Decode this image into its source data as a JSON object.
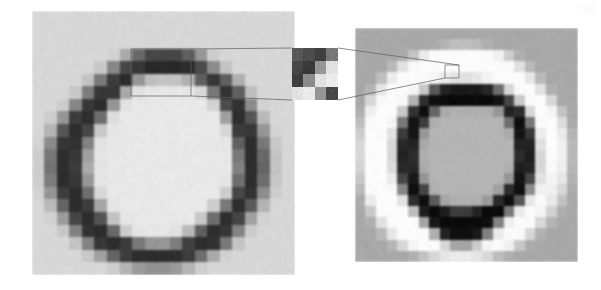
{
  "figure": {
    "background_color": "#ffffff",
    "width": 601,
    "height": 290,
    "caption": "",
    "annotation_color": "#5c5c5c"
  },
  "panels": {
    "left": {
      "name": "original-image-panel",
      "label": "",
      "x": 32,
      "y": 11,
      "width": 263,
      "height": 264,
      "background_color": "#dcdcdc",
      "grid_cols": 21,
      "grid_rows": 21,
      "description": "Low-contrast pixelated ring glyph on light gray field",
      "pixels": [
        [
          215,
          215,
          215,
          215,
          215,
          215,
          215,
          215,
          215,
          215,
          215,
          215,
          215,
          215,
          215,
          215,
          215,
          215,
          215,
          215,
          215
        ],
        [
          215,
          215,
          215,
          215,
          215,
          215,
          215,
          215,
          215,
          215,
          215,
          215,
          215,
          215,
          215,
          215,
          215,
          215,
          215,
          215,
          215
        ],
        [
          215,
          215,
          215,
          215,
          215,
          215,
          215,
          215,
          215,
          215,
          215,
          215,
          215,
          215,
          215,
          215,
          215,
          215,
          215,
          215,
          215
        ],
        [
          215,
          215,
          215,
          215,
          215,
          215,
          210,
          170,
          105,
          70,
          70,
          70,
          95,
          150,
          205,
          215,
          215,
          215,
          215,
          215,
          215
        ],
        [
          215,
          215,
          215,
          215,
          215,
          200,
          135,
          70,
          55,
          40,
          40,
          40,
          45,
          75,
          140,
          195,
          215,
          215,
          215,
          215,
          215
        ],
        [
          215,
          215,
          215,
          215,
          195,
          120,
          60,
          45,
          150,
          190,
          195,
          195,
          175,
          95,
          55,
          95,
          175,
          215,
          215,
          215,
          215
        ],
        [
          215,
          215,
          215,
          200,
          125,
          55,
          55,
          170,
          225,
          230,
          230,
          230,
          230,
          215,
          120,
          50,
          95,
          190,
          215,
          215,
          215
        ],
        [
          215,
          215,
          205,
          135,
          55,
          45,
          150,
          225,
          232,
          232,
          232,
          232,
          232,
          232,
          210,
          75,
          50,
          140,
          210,
          215,
          215
        ],
        [
          215,
          205,
          150,
          60,
          45,
          110,
          220,
          232,
          232,
          232,
          232,
          232,
          232,
          232,
          232,
          160,
          45,
          85,
          185,
          215,
          215
        ],
        [
          215,
          180,
          85,
          45,
          70,
          200,
          230,
          232,
          232,
          232,
          232,
          232,
          232,
          232,
          232,
          215,
          60,
          55,
          150,
          210,
          215
        ],
        [
          210,
          140,
          55,
          50,
          130,
          225,
          232,
          232,
          232,
          232,
          232,
          232,
          232,
          232,
          232,
          230,
          95,
          45,
          120,
          200,
          215
        ],
        [
          205,
          120,
          45,
          55,
          160,
          228,
          232,
          232,
          232,
          232,
          232,
          232,
          232,
          232,
          232,
          232,
          120,
          45,
          105,
          195,
          215
        ],
        [
          205,
          115,
          45,
          60,
          170,
          228,
          232,
          232,
          232,
          232,
          232,
          232,
          232,
          232,
          232,
          232,
          130,
          45,
          100,
          195,
          215
        ],
        [
          205,
          125,
          45,
          55,
          150,
          228,
          232,
          232,
          232,
          232,
          232,
          232,
          232,
          232,
          232,
          228,
          110,
          45,
          110,
          198,
          215
        ],
        [
          210,
          150,
          60,
          45,
          110,
          215,
          232,
          232,
          232,
          232,
          232,
          232,
          232,
          232,
          232,
          205,
          70,
          50,
          140,
          205,
          215
        ],
        [
          215,
          185,
          100,
          45,
          60,
          165,
          228,
          232,
          232,
          232,
          232,
          232,
          232,
          232,
          205,
          120,
          45,
          90,
          180,
          215,
          215
        ],
        [
          215,
          210,
          155,
          70,
          45,
          85,
          195,
          230,
          232,
          232,
          232,
          232,
          232,
          200,
          110,
          45,
          70,
          160,
          210,
          215,
          215
        ],
        [
          215,
          215,
          200,
          130,
          50,
          45,
          105,
          205,
          228,
          230,
          230,
          225,
          185,
          95,
          45,
          55,
          130,
          205,
          215,
          215,
          215
        ],
        [
          215,
          215,
          215,
          195,
          130,
          55,
          45,
          60,
          120,
          150,
          150,
          125,
          65,
          45,
          50,
          120,
          195,
          215,
          215,
          215,
          215
        ],
        [
          215,
          215,
          215,
          215,
          200,
          160,
          100,
          60,
          45,
          45,
          45,
          45,
          60,
          110,
          170,
          210,
          215,
          215,
          215,
          215,
          215
        ],
        [
          215,
          215,
          215,
          215,
          215,
          215,
          205,
          180,
          155,
          145,
          145,
          155,
          180,
          205,
          215,
          215,
          215,
          215,
          215,
          215,
          215
        ]
      ]
    },
    "inset": {
      "name": "magnified-pixel-inset",
      "label": "",
      "x": 292,
      "y": 48,
      "width": 46,
      "height": 52,
      "background_color": "#f2f2f2",
      "grid_cols": 4,
      "grid_rows": 4,
      "description": "Extreme magnification of a 4x4 pixel neighbourhood taken from the top edge of the ring",
      "pixels": [
        [
          88,
          75,
          62,
          120
        ],
        [
          70,
          58,
          150,
          225
        ],
        [
          62,
          140,
          225,
          235
        ],
        [
          225,
          235,
          150,
          72
        ]
      ]
    },
    "right": {
      "name": "enhanced-image-panel",
      "label": "",
      "x": 355,
      "y": 28,
      "width": 223,
      "height": 234,
      "background_color": "#a8a8a8",
      "grid_cols": 21,
      "grid_rows": 21,
      "description": "Contrast-enhanced version of the same ring showing a bright white halo and near-black stroke",
      "pixels": [
        [
          168,
          168,
          168,
          168,
          168,
          168,
          168,
          168,
          168,
          168,
          168,
          168,
          168,
          168,
          168,
          168,
          168,
          168,
          168,
          168,
          168
        ],
        [
          168,
          168,
          168,
          168,
          168,
          168,
          168,
          170,
          180,
          190,
          190,
          185,
          175,
          168,
          168,
          168,
          168,
          168,
          168,
          168,
          168
        ],
        [
          168,
          168,
          168,
          168,
          172,
          195,
          235,
          250,
          252,
          252,
          252,
          252,
          250,
          240,
          205,
          175,
          168,
          168,
          168,
          168,
          168
        ],
        [
          168,
          168,
          168,
          185,
          225,
          250,
          252,
          252,
          252,
          252,
          252,
          252,
          252,
          252,
          250,
          225,
          185,
          168,
          168,
          168,
          168
        ],
        [
          168,
          168,
          190,
          235,
          252,
          252,
          250,
          245,
          235,
          225,
          225,
          230,
          242,
          250,
          252,
          252,
          230,
          185,
          168,
          168,
          168
        ],
        [
          168,
          180,
          230,
          252,
          252,
          245,
          200,
          90,
          35,
          25,
          25,
          25,
          40,
          110,
          215,
          250,
          252,
          225,
          175,
          168,
          168
        ],
        [
          168,
          215,
          250,
          252,
          248,
          180,
          45,
          15,
          10,
          10,
          10,
          10,
          10,
          20,
          70,
          200,
          250,
          252,
          215,
          168,
          168
        ],
        [
          175,
          240,
          252,
          252,
          200,
          50,
          15,
          100,
          170,
          175,
          175,
          175,
          175,
          150,
          35,
          45,
          215,
          252,
          245,
          195,
          168
        ],
        [
          190,
          250,
          252,
          245,
          120,
          20,
          60,
          175,
          180,
          180,
          180,
          180,
          180,
          180,
          110,
          15,
          120,
          250,
          252,
          220,
          170
        ],
        [
          205,
          252,
          252,
          225,
          60,
          20,
          150,
          180,
          180,
          180,
          180,
          180,
          180,
          180,
          170,
          20,
          55,
          235,
          252,
          235,
          180
        ],
        [
          215,
          252,
          252,
          215,
          40,
          35,
          170,
          180,
          180,
          180,
          180,
          180,
          180,
          180,
          180,
          35,
          35,
          225,
          252,
          240,
          185
        ],
        [
          215,
          252,
          252,
          215,
          35,
          45,
          175,
          180,
          180,
          180,
          180,
          180,
          180,
          180,
          180,
          45,
          30,
          215,
          252,
          240,
          185
        ],
        [
          210,
          252,
          252,
          220,
          40,
          40,
          170,
          180,
          180,
          180,
          180,
          180,
          180,
          180,
          175,
          30,
          35,
          215,
          250,
          238,
          182
        ],
        [
          200,
          252,
          252,
          235,
          70,
          25,
          150,
          180,
          180,
          180,
          180,
          180,
          180,
          180,
          150,
          20,
          70,
          225,
          245,
          230,
          178
        ],
        [
          185,
          250,
          252,
          248,
          135,
          15,
          70,
          175,
          180,
          180,
          180,
          180,
          180,
          160,
          45,
          15,
          140,
          240,
          240,
          215,
          172
        ],
        [
          172,
          235,
          252,
          252,
          225,
          45,
          15,
          90,
          165,
          175,
          175,
          175,
          155,
          40,
          15,
          85,
          230,
          250,
          232,
          195,
          168
        ],
        [
          168,
          200,
          250,
          252,
          252,
          190,
          30,
          10,
          30,
          60,
          60,
          35,
          10,
          10,
          120,
          235,
          252,
          245,
          210,
          175,
          168
        ],
        [
          168,
          175,
          225,
          252,
          252,
          252,
          165,
          25,
          10,
          10,
          10,
          10,
          15,
          130,
          240,
          252,
          250,
          215,
          180,
          168,
          168
        ],
        [
          168,
          168,
          185,
          230,
          252,
          252,
          250,
          175,
          35,
          15,
          15,
          25,
          130,
          235,
          252,
          250,
          215,
          178,
          168,
          168,
          168
        ],
        [
          168,
          168,
          168,
          180,
          215,
          245,
          252,
          250,
          215,
          165,
          165,
          205,
          245,
          252,
          240,
          200,
          172,
          168,
          168,
          168,
          168
        ],
        [
          168,
          168,
          168,
          168,
          168,
          175,
          195,
          215,
          230,
          235,
          235,
          230,
          215,
          190,
          175,
          168,
          168,
          168,
          168,
          168,
          168
        ]
      ]
    }
  },
  "annotations": {
    "name": "callout-annotations",
    "stroke_color": "#5c5c5c",
    "left_callout_box": {
      "x": 131,
      "y": 49,
      "width": 60,
      "height": 47
    },
    "right_callout_box": {
      "x": 445,
      "y": 65,
      "width": 14,
      "height": 13
    },
    "leader_lines": [
      {
        "from": [
          191,
          49
        ],
        "to": [
          292,
          48
        ],
        "name": "left-to-inset-top"
      },
      {
        "from": [
          191,
          96
        ],
        "to": [
          292,
          100
        ],
        "name": "left-to-inset-bottom"
      },
      {
        "from": [
          338,
          48
        ],
        "to": [
          459,
          65
        ],
        "name": "inset-to-right-top"
      },
      {
        "from": [
          338,
          100
        ],
        "to": [
          445,
          78
        ],
        "name": "inset-to-right-bottom"
      }
    ]
  },
  "artifacts": {
    "scan_mark": {
      "name": "scan-artifact",
      "visible": true
    }
  }
}
